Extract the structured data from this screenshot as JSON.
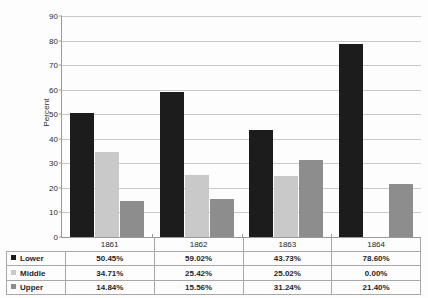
{
  "chart_data": {
    "type": "bar",
    "title": "",
    "xlabel": "",
    "ylabel": "Percent",
    "ylim": [
      0,
      90
    ],
    "ytick_step": 10,
    "yticks": [
      0,
      10,
      20,
      30,
      40,
      50,
      60,
      70,
      80,
      90
    ],
    "grid": true,
    "legend_position": "table-left",
    "categories": [
      "1861",
      "1862",
      "1863",
      "1864"
    ],
    "series": [
      {
        "name": "Lower",
        "color": "#1c1c1c",
        "values": [
          50.45,
          59.02,
          43.73,
          78.6
        ],
        "labels": [
          "50.45%",
          "59.02%",
          "43.73%",
          "78.60%"
        ]
      },
      {
        "name": "Middle",
        "color": "#c9c9c9",
        "values": [
          34.71,
          25.42,
          25.02,
          0.0
        ],
        "labels": [
          "34.71%",
          "25.42%",
          "25.02%",
          "0.00%"
        ]
      },
      {
        "name": "Upper",
        "color": "#8d8d8d",
        "values": [
          14.84,
          15.56,
          31.24,
          21.4
        ],
        "labels": [
          "14.84%",
          "15.56%",
          "31.24%",
          "21.40%"
        ]
      }
    ]
  },
  "axis": {
    "y_title": "Percent"
  },
  "colors": {
    "gridline": "#c9c9c9",
    "axis": "#9a9a9a",
    "table_border": "#a8a8a8",
    "background": "#fdfdfd"
  }
}
